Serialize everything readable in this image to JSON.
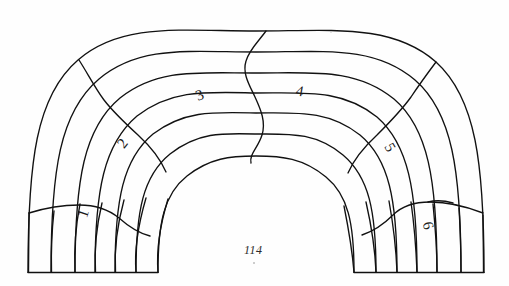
{
  "document": {
    "page_number": "114",
    "figure_type": "hand-drawn arch voussoir diagram",
    "background_color": "#fefefe",
    "ink_color": "#111111"
  },
  "figure": {
    "title": "",
    "geometry": {
      "center_x": 256,
      "center_y": 272,
      "baseline_y": 272,
      "ring_count": 6,
      "radii": [
        98,
        120,
        141,
        161,
        181,
        205,
        228
      ],
      "start_angle_deg": 180,
      "end_angle_deg": 0
    },
    "zones": [
      {
        "id": "zone-1",
        "label": "1",
        "x": 80,
        "y": 206,
        "rotate": -72
      },
      {
        "id": "zone-2",
        "label": "2",
        "x": 119,
        "y": 136,
        "rotate": -52
      },
      {
        "id": "zone-3",
        "label": "3",
        "x": 196,
        "y": 88,
        "rotate": -22
      },
      {
        "id": "zone-4",
        "label": "4",
        "x": 296,
        "y": 84,
        "rotate": 10
      },
      {
        "id": "zone-5",
        "label": "5",
        "x": 386,
        "y": 140,
        "rotate": 60
      },
      {
        "id": "zone-6",
        "label": "6",
        "x": 424,
        "y": 218,
        "rotate": 74
      }
    ],
    "radial_joint_count_left_base": 7,
    "radial_joint_count_right_base": 7
  }
}
